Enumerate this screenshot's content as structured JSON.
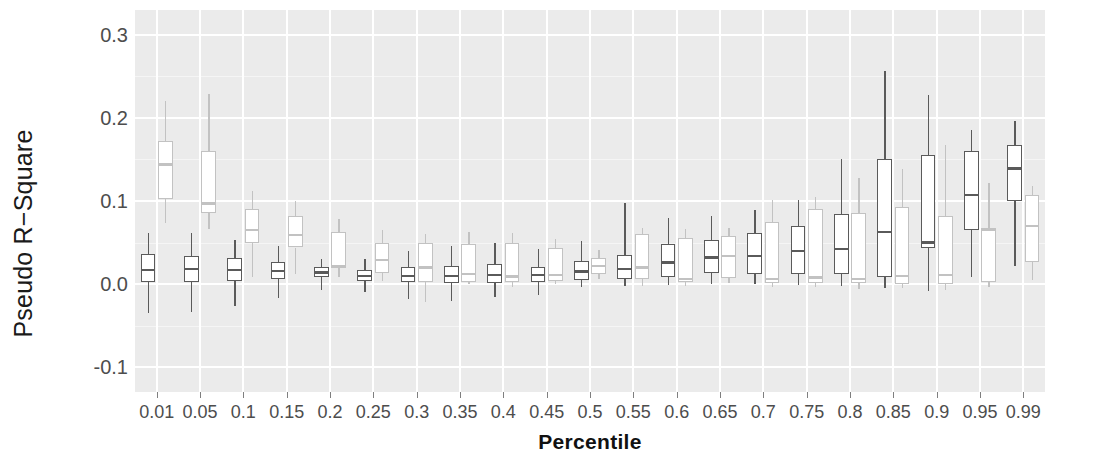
{
  "chart_data": {
    "type": "box",
    "title": "",
    "xlabel": "Percentile",
    "ylabel": "Pseudo R−Square",
    "ylim": [
      -0.13,
      0.33
    ],
    "yticks": [
      -0.1,
      0.0,
      0.1,
      0.2,
      0.3
    ],
    "ytick_labels": [
      "-0.1",
      "0.0",
      "0.1",
      "0.2",
      "0.3"
    ],
    "yminor": [
      -0.05,
      0.05,
      0.15,
      0.25
    ],
    "grid": true,
    "legend": "none",
    "panel_background": "#ebebeb",
    "grid_color": "#ffffff",
    "categories": [
      "0.01",
      "0.05",
      "0.1",
      "0.15",
      "0.2",
      "0.25",
      "0.3",
      "0.35",
      "0.4",
      "0.45",
      "0.5",
      "0.55",
      "0.6",
      "0.65",
      "0.7",
      "0.75",
      "0.8",
      "0.85",
      "0.9",
      "0.95",
      "0.99"
    ],
    "series": [
      {
        "name": "series-a",
        "color": "#5a5a5a",
        "fill": "#ffffff",
        "boxes": [
          {
            "lower": 0.001,
            "q1": 0.002,
            "median": 0.017,
            "q3": 0.036,
            "upper": 0.061,
            "whisker_low": -0.035
          },
          {
            "lower": -0.034,
            "q1": 0.003,
            "median": 0.018,
            "q3": 0.034,
            "upper": 0.062,
            "whisker_low": -0.034
          },
          {
            "lower": -0.026,
            "q1": 0.004,
            "median": 0.017,
            "q3": 0.031,
            "upper": 0.053,
            "whisker_low": -0.026
          },
          {
            "lower": -0.017,
            "q1": 0.006,
            "median": 0.016,
            "q3": 0.027,
            "upper": 0.046,
            "whisker_low": -0.017
          },
          {
            "lower": -0.007,
            "q1": 0.008,
            "median": 0.014,
            "q3": 0.02,
            "upper": 0.03,
            "whisker_low": -0.007
          },
          {
            "lower": -0.009,
            "q1": 0.004,
            "median": 0.01,
            "q3": 0.017,
            "upper": 0.03,
            "whisker_low": -0.009
          },
          {
            "lower": -0.018,
            "q1": 0.002,
            "median": 0.01,
            "q3": 0.02,
            "upper": 0.04,
            "whisker_low": -0.018
          },
          {
            "lower": -0.02,
            "q1": 0.001,
            "median": 0.01,
            "q3": 0.022,
            "upper": 0.046,
            "whisker_low": -0.02
          },
          {
            "lower": -0.016,
            "q1": 0.001,
            "median": 0.011,
            "q3": 0.024,
            "upper": 0.05,
            "whisker_low": -0.016
          },
          {
            "lower": -0.013,
            "q1": 0.002,
            "median": 0.011,
            "q3": 0.021,
            "upper": 0.042,
            "whisker_low": -0.013
          },
          {
            "lower": -0.004,
            "q1": 0.005,
            "median": 0.015,
            "q3": 0.028,
            "upper": 0.052,
            "whisker_low": -0.004
          },
          {
            "lower": -0.002,
            "q1": 0.006,
            "median": 0.018,
            "q3": 0.035,
            "upper": 0.098,
            "whisker_low": -0.002
          },
          {
            "lower": -0.001,
            "q1": 0.009,
            "median": 0.026,
            "q3": 0.048,
            "upper": 0.08,
            "whisker_low": -0.001
          },
          {
            "lower": 0.0,
            "q1": 0.013,
            "median": 0.032,
            "q3": 0.053,
            "upper": 0.082,
            "whisker_low": 0.0
          },
          {
            "lower": 0.0,
            "q1": 0.012,
            "median": 0.034,
            "q3": 0.062,
            "upper": 0.089,
            "whisker_low": 0.0
          },
          {
            "lower": -0.001,
            "q1": 0.012,
            "median": 0.04,
            "q3": 0.07,
            "upper": 0.101,
            "whisker_low": -0.001
          },
          {
            "lower": -0.002,
            "q1": 0.012,
            "median": 0.042,
            "q3": 0.084,
            "upper": 0.15,
            "whisker_low": -0.002
          },
          {
            "lower": -0.005,
            "q1": 0.008,
            "median": 0.063,
            "q3": 0.15,
            "upper": 0.256,
            "whisker_low": -0.005
          },
          {
            "lower": -0.008,
            "q1": 0.043,
            "median": 0.05,
            "q3": 0.155,
            "upper": 0.228,
            "whisker_low": -0.008
          },
          {
            "lower": 0.009,
            "q1": 0.065,
            "median": 0.107,
            "q3": 0.16,
            "upper": 0.185,
            "whisker_low": 0.009
          },
          {
            "lower": 0.022,
            "q1": 0.1,
            "median": 0.139,
            "q3": 0.168,
            "upper": 0.196,
            "whisker_low": 0.022
          }
        ]
      },
      {
        "name": "series-b",
        "color": "#c2c2c2",
        "fill": "#ffffff",
        "boxes": [
          {
            "lower": 0.073,
            "q1": 0.103,
            "median": 0.144,
            "q3": 0.172,
            "upper": 0.22,
            "whisker_low": 0.073
          },
          {
            "lower": 0.066,
            "q1": 0.086,
            "median": 0.097,
            "q3": 0.16,
            "upper": 0.229,
            "whisker_low": 0.066
          },
          {
            "lower": 0.009,
            "q1": 0.05,
            "median": 0.065,
            "q3": 0.09,
            "upper": 0.112,
            "whisker_low": 0.009
          },
          {
            "lower": 0.012,
            "q1": 0.044,
            "median": 0.059,
            "q3": 0.082,
            "upper": 0.1,
            "whisker_low": 0.012
          },
          {
            "lower": 0.008,
            "q1": 0.019,
            "median": 0.022,
            "q3": 0.063,
            "upper": 0.078,
            "whisker_low": 0.008
          },
          {
            "lower": 0.004,
            "q1": 0.013,
            "median": 0.029,
            "q3": 0.05,
            "upper": 0.065,
            "whisker_low": 0.004
          },
          {
            "lower": -0.022,
            "q1": 0.003,
            "median": 0.02,
            "q3": 0.049,
            "upper": 0.06,
            "whisker_low": -0.022
          },
          {
            "lower": 0.0,
            "q1": 0.003,
            "median": 0.012,
            "q3": 0.048,
            "upper": 0.063,
            "whisker_low": 0.0
          },
          {
            "lower": -0.003,
            "q1": 0.002,
            "median": 0.009,
            "q3": 0.05,
            "upper": 0.062,
            "whisker_low": -0.003
          },
          {
            "lower": 0.0,
            "q1": 0.004,
            "median": 0.011,
            "q3": 0.043,
            "upper": 0.054,
            "whisker_low": 0.0
          },
          {
            "lower": 0.006,
            "q1": 0.012,
            "median": 0.022,
            "q3": 0.031,
            "upper": 0.041,
            "whisker_low": 0.006
          },
          {
            "lower": -0.002,
            "q1": 0.006,
            "median": 0.02,
            "q3": 0.06,
            "upper": 0.068,
            "whisker_low": -0.002
          },
          {
            "lower": -0.002,
            "q1": 0.003,
            "median": 0.006,
            "q3": 0.055,
            "upper": 0.066,
            "whisker_low": -0.002
          },
          {
            "lower": 0.001,
            "q1": 0.007,
            "median": 0.034,
            "q3": 0.058,
            "upper": 0.067,
            "whisker_low": 0.001
          },
          {
            "lower": -0.004,
            "q1": 0.001,
            "median": 0.006,
            "q3": 0.075,
            "upper": 0.101,
            "whisker_low": -0.004
          },
          {
            "lower": -0.003,
            "q1": 0.001,
            "median": 0.008,
            "q3": 0.09,
            "upper": 0.105,
            "whisker_low": -0.003
          },
          {
            "lower": -0.006,
            "q1": 0.001,
            "median": 0.006,
            "q3": 0.085,
            "upper": 0.128,
            "whisker_low": -0.006
          },
          {
            "lower": -0.005,
            "q1": 0.0,
            "median": 0.01,
            "q3": 0.093,
            "upper": 0.138,
            "whisker_low": -0.005
          },
          {
            "lower": -0.007,
            "q1": 0.0,
            "median": 0.011,
            "q3": 0.082,
            "upper": 0.167,
            "whisker_low": -0.007
          },
          {
            "lower": -0.004,
            "q1": 0.003,
            "median": 0.065,
            "q3": 0.068,
            "upper": 0.122,
            "whisker_low": -0.004
          },
          {
            "lower": 0.005,
            "q1": 0.026,
            "median": 0.07,
            "q3": 0.107,
            "upper": 0.118,
            "whisker_low": 0.005
          }
        ]
      }
    ]
  }
}
